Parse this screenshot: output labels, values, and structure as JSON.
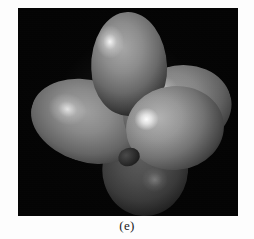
{
  "figure": {
    "caption": "(e)",
    "panel_background": "#040404",
    "page_background": "#ffffff",
    "balloons": [
      {
        "name": "top-balloon",
        "position": "top",
        "tone": "light-gray",
        "color": "#8d8d8d",
        "highlight": "upper-left"
      },
      {
        "name": "left-balloon",
        "position": "left-lower",
        "tone": "mid-gray",
        "color": "#8a8a8a",
        "highlight": "left"
      },
      {
        "name": "right-back-balloon",
        "position": "upper-right-back",
        "tone": "mid-gray",
        "color": "#868686",
        "highlight": "upper-left"
      },
      {
        "name": "front-balloon",
        "position": "right-front",
        "tone": "bright-gray",
        "color": "#999999",
        "highlight": "left-specular"
      },
      {
        "name": "bottom-balloon",
        "position": "bottom",
        "tone": "dark-gray",
        "color": "#4d4d4d",
        "highlight": "faint-right"
      }
    ]
  }
}
